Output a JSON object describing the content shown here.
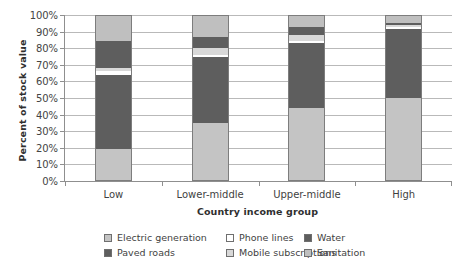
{
  "chart_data": {
    "type": "bar",
    "subtype": "stacked-bar-100-percent",
    "title": "",
    "xlabel": "Country income group",
    "ylabel": "Percent of stock value",
    "categories": [
      "Low",
      "Lower-middle",
      "Upper-middle",
      "High"
    ],
    "ylim": [
      0,
      100
    ],
    "ytick_labels": [
      "0%",
      "10%",
      "20%",
      "30%",
      "40%",
      "50%",
      "60%",
      "70%",
      "80%",
      "90%",
      "100%"
    ],
    "ytick_values": [
      0,
      10,
      20,
      30,
      40,
      50,
      60,
      70,
      80,
      90,
      100
    ],
    "grid": true,
    "legend_position": "bottom",
    "series": [
      {
        "name": "Electric generation",
        "color": "#c4c4c4",
        "values": [
          19,
          35,
          44,
          50
        ]
      },
      {
        "name": "Paved roads",
        "color": "#5e5e5e",
        "values": [
          45,
          40,
          39.5,
          42
        ]
      },
      {
        "name": "Phone lines",
        "color": "#ffffff",
        "values": [
          2.5,
          1,
          1.5,
          1
        ]
      },
      {
        "name": "Mobile subscriptions",
        "color": "#d8d8d8",
        "values": [
          1.5,
          4.5,
          3.5,
          1.5
        ]
      },
      {
        "name": "Water",
        "color": "#5e5e5e",
        "values": [
          16.5,
          6.5,
          4.5,
          1.5
        ]
      },
      {
        "name": "Sanitation",
        "color": "#bfbfbf",
        "values": [
          15.5,
          13,
          7,
          4
        ]
      }
    ]
  },
  "legend": {
    "entries": [
      {
        "label": "Electric generation",
        "color": "#c4c4c4"
      },
      {
        "label": "Paved roads",
        "color": "#5e5e5e"
      },
      {
        "label": "Phone lines",
        "color": "#ffffff"
      },
      {
        "label": "Mobile subscriptions",
        "color": "#d8d8d8"
      },
      {
        "label": "Water",
        "color": "#5e5e5e"
      },
      {
        "label": "Sanitation",
        "color": "#bfbfbf"
      }
    ]
  },
  "colors": {
    "axis": "#8f8f8f",
    "grid": "#b9b9b9",
    "text": "#3b3b3b",
    "background": "#ffffff"
  }
}
